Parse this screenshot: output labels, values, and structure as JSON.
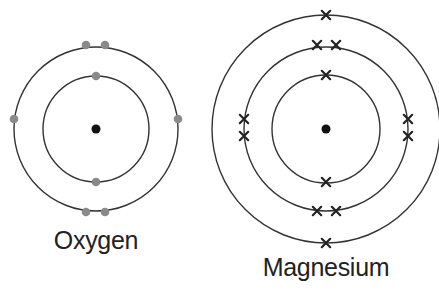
{
  "diagram": {
    "type": "bohr-model-electron-shells",
    "colors": {
      "ring": "#333333",
      "nucleus": "#111111",
      "oxygen_electron": "#8a8a8a",
      "magnesium_electron": "#222222",
      "label": "#222222"
    },
    "atoms": [
      {
        "name": "Oxygen",
        "label": "Oxygen",
        "center": [
          96,
          129
        ],
        "electron_symbol": "dot",
        "shells": [
          {
            "radius": 53,
            "electrons": 2,
            "positions": [
              [
                96,
                76
              ],
              [
                96,
                182
              ]
            ]
          },
          {
            "radius": 82,
            "electrons": 6,
            "positions": [
              [
                86,
                45
              ],
              [
                105,
                45
              ],
              [
                14,
                119
              ],
              [
                178,
                119
              ],
              [
                86,
                212
              ],
              [
                105,
                212
              ]
            ]
          }
        ],
        "label_pos": [
          96,
          246
        ]
      },
      {
        "name": "Magnesium",
        "label": "Magnesium",
        "center": [
          326,
          129
        ],
        "electron_symbol": "cross",
        "shells": [
          {
            "radius": 54,
            "electrons": 2,
            "positions": [
              [
                326,
                75
              ],
              [
                326,
                182
              ]
            ]
          },
          {
            "radius": 82,
            "electrons": 8,
            "positions": [
              [
                317,
                45
              ],
              [
                336,
                45
              ],
              [
                244,
                119
              ],
              [
                244,
                136
              ],
              [
                408,
                119
              ],
              [
                408,
                136
              ],
              [
                317,
                211
              ],
              [
                336,
                211
              ]
            ]
          },
          {
            "radius": 114,
            "electrons": 2,
            "positions": [
              [
                326,
                15
              ],
              [
                326,
                243
              ]
            ]
          }
        ],
        "label_pos": [
          326,
          273
        ]
      }
    ]
  }
}
